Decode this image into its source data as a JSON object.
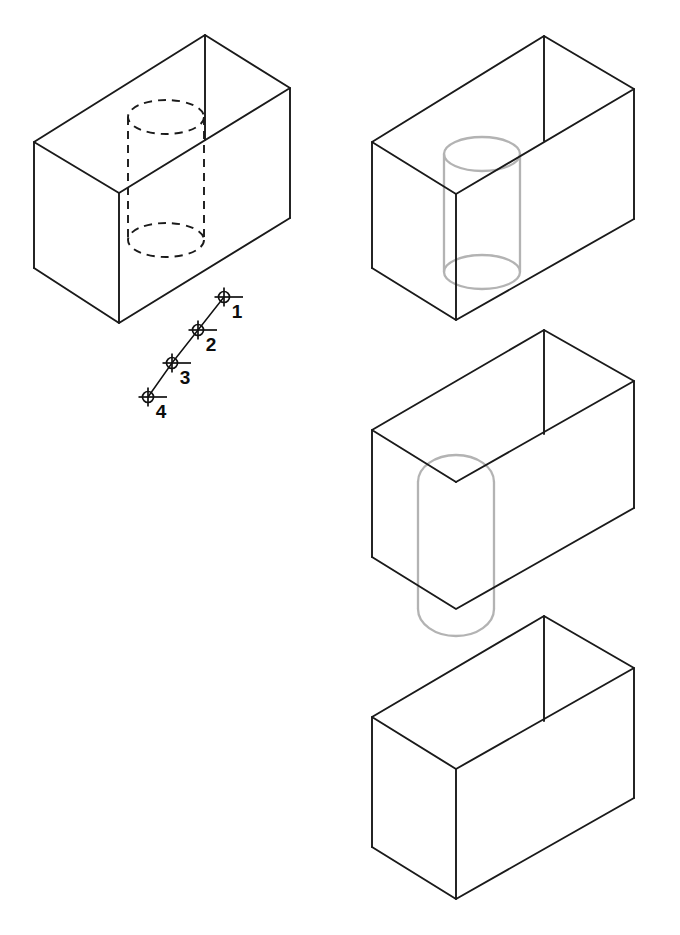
{
  "figure": {
    "background_color": "#ffffff",
    "solid_edge_color": "#1a1a1a",
    "hidden_edge_color": "#1a1a1a",
    "ghost_edge_color": "#b3b3b3",
    "label_color": "#0d0d0d",
    "panel_count": 4
  },
  "panels": [
    {
      "id": "panel-1",
      "name": "block-with-hidden-hole",
      "position": "top-left",
      "feature": "dashed hidden cylindrical hole",
      "feature_style": "hidden-dashed",
      "box": {
        "apex_top": [
          205,
          35
        ],
        "left_top": [
          34,
          142
        ],
        "right_top": [
          290,
          88
        ],
        "front_top": [
          119,
          193
        ],
        "left_bottom": [
          34,
          268
        ],
        "right_bottom": [
          290,
          218
        ],
        "front_bottom": [
          119,
          323
        ]
      },
      "cylinder": {
        "center_x": 166,
        "top_center_y": 117,
        "bottom_center_y": 240,
        "rx": 38,
        "ry": 17
      }
    },
    {
      "id": "panel-2",
      "name": "block-with-ghost-cylinder",
      "position": "top-right",
      "feature": "light grey solid cylinder inside block",
      "feature_style": "ghost-solid",
      "box": {
        "apex_top": [
          544,
          36
        ],
        "left_top": [
          372,
          142
        ],
        "right_top": [
          634,
          89
        ],
        "front_top": [
          456,
          194
        ],
        "left_bottom": [
          372,
          268
        ],
        "right_bottom": [
          634,
          219
        ],
        "front_bottom": [
          456,
          320
        ]
      },
      "cylinder": {
        "center_x": 482,
        "top_center_y": 154,
        "bottom_center_y": 272,
        "rx": 38,
        "ry": 17
      }
    },
    {
      "id": "panel-3",
      "name": "block-with-half-groove",
      "position": "middle-right",
      "feature": "light grey half-cylinder groove on front face",
      "feature_style": "ghost-solid",
      "box": {
        "apex_top": [
          544,
          330
        ],
        "left_top": [
          372,
          430
        ],
        "right_top": [
          634,
          381
        ],
        "front_top": [
          456,
          482
        ],
        "left_bottom": [
          372,
          557
        ],
        "right_bottom": [
          634,
          508
        ],
        "front_bottom": [
          456,
          609
        ]
      },
      "groove": {
        "center_x": 456,
        "top_arc_y": 482,
        "bottom_arc_y": 609,
        "rx": 38,
        "ry": 17,
        "arc_rise": 27
      }
    },
    {
      "id": "panel-4",
      "name": "plain-block",
      "position": "bottom-right",
      "feature": "none",
      "feature_style": "none",
      "box": {
        "apex_top": [
          544,
          616
        ],
        "left_top": [
          372,
          717
        ],
        "right_top": [
          634,
          668
        ],
        "front_top": [
          456,
          769
        ],
        "left_bottom": [
          372,
          847
        ],
        "right_bottom": [
          634,
          798
        ],
        "front_bottom": [
          456,
          899
        ]
      }
    }
  ],
  "point_chain": {
    "name": "numbered-point-polyline",
    "marker_style": "circle-with-crosshair",
    "marker_radius": 5.5,
    "crosshair_length": 19,
    "points": [
      {
        "label": "1",
        "x": 224,
        "y": 297,
        "label_x": 237,
        "label_y": 313
      },
      {
        "label": "2",
        "x": 198,
        "y": 330,
        "label_x": 211,
        "label_y": 346
      },
      {
        "label": "3",
        "x": 172,
        "y": 363,
        "label_x": 185,
        "label_y": 379
      },
      {
        "label": "4",
        "x": 148,
        "y": 397,
        "label_x": 161,
        "label_y": 413
      }
    ]
  }
}
